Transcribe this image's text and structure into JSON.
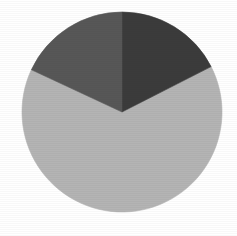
{
  "background_color": "#ffffff",
  "chart_data": {
    "type": "pie",
    "title": "",
    "subtitle": "",
    "xlabel": "",
    "ylabel": "",
    "grid": false,
    "legend": false,
    "legend_position": "none",
    "labels_shown": false,
    "center": {
      "cx": 122,
      "cy": 112
    },
    "radius": 100,
    "start_angle_deg": 0,
    "direction": "clockwise",
    "categories": [
      "Slice 1",
      "Slice 2",
      "Slice 3"
    ],
    "values": [
      64.5,
      17.5,
      18.0
    ],
    "colors": [
      "#b4b4b4",
      "#3b3b3b",
      "#575757"
    ],
    "slices": [
      {
        "name": "Slice 1",
        "value": 64.5,
        "percent": "64.5%",
        "color": "#b4b4b4",
        "shade": "light-gray",
        "start_angle_deg": 63,
        "end_angle_deg": 295,
        "sweep_deg": 232,
        "label": ""
      },
      {
        "name": "Slice 2",
        "value": 17.5,
        "percent": "17.5%",
        "color": "#3b3b3b",
        "shade": "dark-gray",
        "start_angle_deg": 0,
        "end_angle_deg": 63,
        "sweep_deg": 63,
        "label": ""
      },
      {
        "name": "Slice 3",
        "value": 18.0,
        "percent": "18.0%",
        "color": "#575757",
        "shade": "medium-gray",
        "start_angle_deg": 295,
        "end_angle_deg": 360,
        "sweep_deg": 65,
        "label": ""
      }
    ]
  }
}
